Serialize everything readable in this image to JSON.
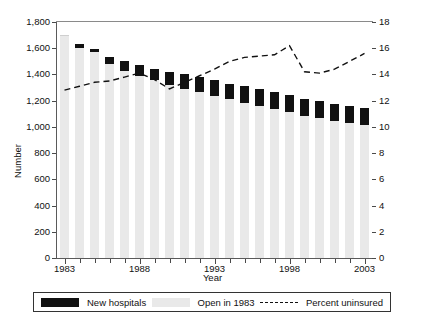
{
  "axes": {
    "ylabel_left": "Number",
    "xlabel": "Year",
    "yticks_left": [
      "0",
      "200",
      "400",
      "600",
      "800",
      "1,000",
      "1,200",
      "1,400",
      "1,600",
      "1,800"
    ],
    "yticks_right": [
      "0",
      "2",
      "4",
      "6",
      "8",
      "10",
      "12",
      "14",
      "16",
      "18"
    ],
    "xticks_major": [
      "1983",
      "1988",
      "1993",
      "1998",
      "2003"
    ]
  },
  "legend": {
    "items": [
      {
        "label": "New hospitals",
        "swatch": "black-square",
        "color": "#111111"
      },
      {
        "label": "Open in 1983",
        "swatch": "grey-square",
        "color": "#e9e9e9"
      },
      {
        "label": "Percent uninsured",
        "swatch": "dashed-line",
        "color": "#111111"
      }
    ]
  },
  "chart_data": {
    "type": "bar",
    "title": "",
    "xlabel": "Year",
    "ylabel": "Number",
    "ylabel_secondary": "",
    "grid": false,
    "legend_position": "bottom",
    "ylim": [
      0,
      1800
    ],
    "ylim_secondary": [
      0,
      18
    ],
    "ytick_step": 200,
    "ytick_step_secondary": 2,
    "categories": [
      1983,
      1984,
      1985,
      1986,
      1987,
      1988,
      1989,
      1990,
      1991,
      1992,
      1993,
      1994,
      1995,
      1996,
      1997,
      1998,
      1999,
      2000,
      2001,
      2002,
      2003
    ],
    "series": [
      {
        "name": "Open in 1983",
        "axis": "left",
        "type": "bar-segment",
        "color": "#e9e9e9",
        "values": [
          1690,
          1600,
          1570,
          1480,
          1425,
          1390,
          1355,
          1320,
          1290,
          1265,
          1235,
          1210,
          1185,
          1160,
          1135,
          1110,
          1085,
          1065,
          1045,
          1030,
          1015
        ]
      },
      {
        "name": "New hospitals",
        "axis": "left",
        "type": "bar-segment",
        "color": "#111111",
        "values": [
          0,
          30,
          25,
          55,
          80,
          85,
          90,
          95,
          110,
          115,
          120,
          120,
          125,
          130,
          130,
          130,
          130,
          130,
          130,
          130,
          130
        ]
      },
      {
        "name": "Percent uninsured",
        "axis": "right",
        "type": "line",
        "style": "dashed",
        "color": "#111111",
        "values": [
          12.8,
          13.1,
          13.4,
          13.5,
          13.8,
          14.1,
          13.6,
          12.9,
          13.4,
          13.9,
          14.4,
          15.0,
          15.3,
          15.4,
          15.5,
          16.2,
          14.2,
          14.1,
          14.4,
          15.0,
          15.6
        ]
      }
    ]
  }
}
